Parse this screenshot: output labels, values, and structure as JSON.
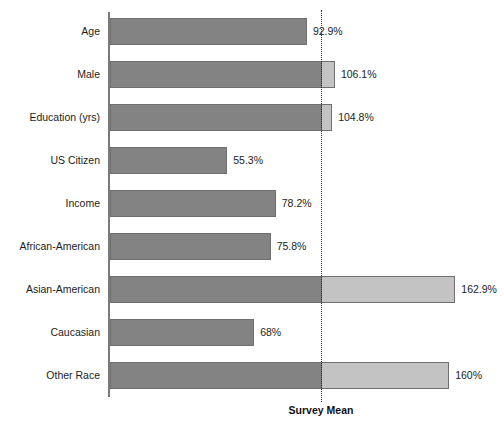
{
  "chart_data": {
    "type": "bar",
    "orientation": "horizontal",
    "title": "",
    "xlabel": "",
    "ylabel": "",
    "categories": [
      "Age",
      "Male",
      "Education (yrs)",
      "US Citizen",
      "Income",
      "African-American",
      "Asian-American",
      "Caucasian",
      "Other Race"
    ],
    "values": [
      92.9,
      106.1,
      104.8,
      55.3,
      78.2,
      75.8,
      162.9,
      68,
      160
    ],
    "value_labels": [
      "92.9%",
      "106.1%",
      "104.8%",
      "55.3%",
      "78.2%",
      "75.8%",
      "162.9%",
      "68%",
      "160%"
    ],
    "xlim": [
      0,
      175
    ],
    "grid": false,
    "legend": "none",
    "reference_line": {
      "label": "Survey Mean",
      "value": 100,
      "style": "dotted"
    },
    "colors": {
      "below_mean_fill": "#838383",
      "above_mean_fill": "#c3c3c3",
      "bar_border": "#6f6f6f",
      "axis": "#7a7a7a",
      "reference_line": "#2b2b2b",
      "text": "#1c1c1c",
      "background": "#ffffff"
    }
  }
}
